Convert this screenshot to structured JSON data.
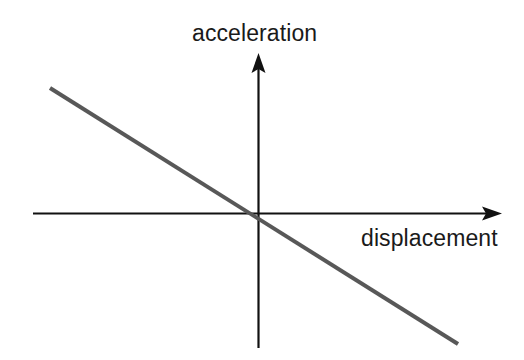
{
  "figure": {
    "background_color": "#ffffff",
    "width": 524,
    "height": 360,
    "axis_color": "#111111",
    "line_color": "#585858",
    "text_color": "#1a1a1a"
  },
  "labels": {
    "y_axis": "acceleration",
    "x_axis": "displacement"
  },
  "chart_data": {
    "type": "line",
    "title": "",
    "subtitle": "",
    "xlabel": "displacement",
    "ylabel": "acceleration",
    "grid": false,
    "legend": null,
    "axes_style": "arrowed-cartesian-through-origin",
    "x_axis": {
      "label": "displacement",
      "label_position": "below-right-of-axis",
      "arrow": "right",
      "pixel_start": [
        33,
        213
      ],
      "pixel_end": [
        502,
        213
      ],
      "origin_pixel": [
        258,
        213
      ],
      "ticks": [],
      "tick_labels": []
    },
    "y_axis": {
      "label": "acceleration",
      "label_position": "above-axis-centered",
      "arrow": "up",
      "pixel_start": [
        258,
        348
      ],
      "pixel_end": [
        258,
        53
      ],
      "ticks": [],
      "tick_labels": []
    },
    "series": [
      {
        "name": "acceleration vs displacement",
        "color": "#585858",
        "width_px": 4,
        "relationship": "linear, negative slope, passes through origin",
        "slope": -0.627,
        "intercept": 0,
        "x": [
          -1.0,
          0.0,
          1.0
        ],
        "y": [
          0.627,
          0.0,
          -0.627
        ],
        "pixel_points": [
          [
            50,
            88
          ],
          [
            258,
            213
          ],
          [
            458,
            344
          ]
        ]
      }
    ],
    "annotations": [],
    "xlim": [
      -1.11,
      1.0
    ],
    "ylim": [
      -0.68,
      0.81
    ]
  }
}
